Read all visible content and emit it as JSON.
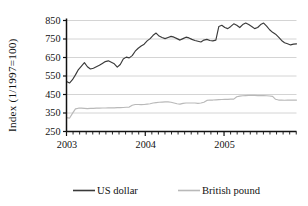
{
  "chart_data": {
    "type": "line",
    "title": "",
    "xlabel": "",
    "ylabel": "Index (1/1997=100)",
    "ylim": [
      250,
      850
    ],
    "yticks": [
      250,
      350,
      450,
      550,
      650,
      750,
      850
    ],
    "ytick_labels": [
      "250",
      "350",
      "450",
      "550",
      "650",
      "750",
      "850"
    ],
    "xlim": [
      2003.0,
      2005.92
    ],
    "xticks": [
      2003,
      2004,
      2005
    ],
    "xtick_labels": [
      "2003",
      "2004",
      "2005"
    ],
    "x_minor_tick_interval_months": 1,
    "grid": "horizontal",
    "legend_position": "bottom",
    "legend": [
      "US dollar",
      "British pound"
    ],
    "colors": {
      "us_dollar": "#3a3a3a",
      "british_pound": "#b9b9b9",
      "axis": "#111111",
      "grid": "#c9c9c9",
      "background": "#ffffff"
    },
    "x": [
      2003.0,
      2003.08,
      2003.17,
      2003.25,
      2003.33,
      2003.42,
      2003.5,
      2003.58,
      2003.67,
      2003.75,
      2003.83,
      2003.92,
      2004.0,
      2004.08,
      2004.17,
      2004.25,
      2004.33,
      2004.42,
      2004.5,
      2004.58,
      2004.67,
      2004.75,
      2004.83,
      2004.92,
      2005.0,
      2005.08,
      2005.17,
      2005.25,
      2005.33,
      2005.42,
      2005.5,
      2005.58,
      2005.67,
      2005.75,
      2005.83,
      2005.92
    ],
    "series": [
      {
        "name": "US dollar",
        "color": "#3a3a3a",
        "values": [
          520,
          545,
          600,
          625,
          588,
          598,
          615,
          628,
          630,
          620,
          595,
          655,
          648,
          690,
          720,
          735,
          778,
          760,
          752,
          755,
          762,
          748,
          742,
          755,
          740,
          745,
          742,
          820,
          812,
          832,
          818,
          838,
          828,
          800,
          790,
          722
        ],
        "detail_values": [
          520,
          512,
          530,
          556,
          585,
          604,
          622,
          600,
          588,
          592,
          600,
          608,
          618,
          628,
          632,
          624,
          616,
          598,
          612,
          642,
          652,
          648,
          660,
          684,
          700,
          712,
          722,
          740,
          752,
          770,
          782,
          766,
          758,
          752,
          758,
          764,
          760,
          752,
          744,
          752,
          760,
          756,
          748,
          742,
          738,
          734,
          744,
          748,
          742,
          740,
          744,
          818,
          824,
          812,
          806,
          818,
          832,
          824,
          812,
          828,
          836,
          828,
          818,
          806,
          812,
          828,
          836,
          820,
          800,
          786,
          776,
          760,
          742,
          730,
          724,
          718,
          722,
          724
        ]
      },
      {
        "name": "British pound",
        "color": "#b9b9b9",
        "values": [
          325,
          372,
          376,
          375,
          374,
          375,
          376,
          377,
          378,
          378,
          379,
          380,
          382,
          394,
          396,
          395,
          398,
          404,
          408,
          410,
          409,
          405,
          400,
          404,
          408,
          418,
          420,
          422,
          424,
          425,
          440,
          444,
          445,
          444,
          443,
          420
        ],
        "detail_values": [
          325,
          322,
          348,
          372,
          376,
          376,
          375,
          374,
          375,
          375,
          376,
          376,
          377,
          377,
          378,
          378,
          378,
          379,
          379,
          380,
          381,
          382,
          392,
          396,
          396,
          395,
          396,
          398,
          400,
          404,
          406,
          408,
          409,
          410,
          410,
          408,
          404,
          400,
          398,
          402,
          404,
          404,
          404,
          404,
          402,
          404,
          408,
          418,
          420,
          420,
          421,
          422,
          423,
          424,
          424,
          425,
          425,
          438,
          441,
          443,
          444,
          445,
          445,
          445,
          444,
          444,
          444,
          443,
          442,
          440,
          424,
          420,
          420,
          419,
          420,
          420,
          420,
          420
        ]
      }
    ]
  },
  "legend_items": [
    {
      "label": "US dollar",
      "color": "#3a3a3a"
    },
    {
      "label": "British pound",
      "color": "#b9b9b9"
    }
  ]
}
